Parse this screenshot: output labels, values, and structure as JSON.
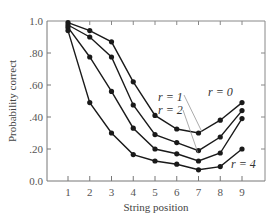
{
  "chart_data": {
    "type": "line",
    "title": "",
    "xlabel": "String position",
    "ylabel": "Probability correct",
    "x": [
      1,
      2,
      3,
      4,
      5,
      6,
      7,
      8,
      9
    ],
    "xticks": [
      "1",
      "2",
      "3",
      "4",
      "5",
      "6",
      "7",
      "8",
      "9"
    ],
    "yticks": [
      "0.0",
      ".20",
      ".40",
      ".60",
      ".80",
      "1.0"
    ],
    "ylim": [
      0,
      1.0
    ],
    "xlim": [
      0,
      10
    ],
    "grid": false,
    "series": [
      {
        "name": "r = 0",
        "values": [
          0.99,
          0.94,
          0.87,
          0.62,
          0.41,
          0.325,
          0.3,
          0.38,
          0.49
        ]
      },
      {
        "name": "r = 1",
        "values": [
          0.975,
          0.9,
          0.775,
          0.475,
          0.29,
          0.24,
          0.19,
          0.275,
          0.44
        ]
      },
      {
        "name": "r = 2",
        "values": [
          0.96,
          0.775,
          0.56,
          0.33,
          0.2,
          0.17,
          0.125,
          0.175,
          0.39
        ]
      },
      {
        "name": "r = 4",
        "values": [
          0.94,
          0.49,
          0.3,
          0.165,
          0.125,
          0.105,
          0.07,
          0.09,
          0.2
        ]
      }
    ],
    "annotations": [
      {
        "text": "r = 0",
        "series": "r = 0"
      },
      {
        "text": "r = 1",
        "series": "r = 1"
      },
      {
        "text": "r = 2",
        "series": "r = 2"
      },
      {
        "text": "r = 4",
        "series": "r = 4"
      }
    ]
  },
  "labels": {
    "xlabel": "String position",
    "ylabel": "Probability correct",
    "r0": "r = 0",
    "r1": "r = 1",
    "r2": "r = 2",
    "r4": "r = 4"
  },
  "colors": {
    "line": "#1a1a1a",
    "axis": "#777777",
    "text": "#444444"
  }
}
